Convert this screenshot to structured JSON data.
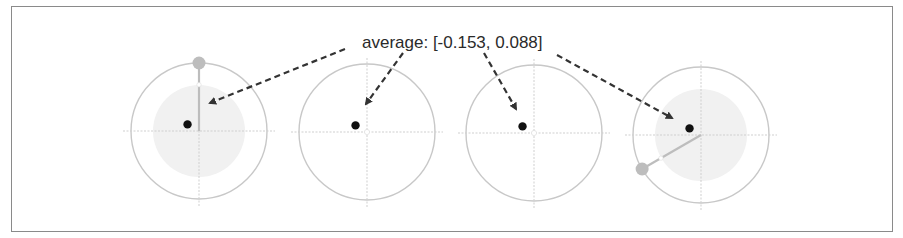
{
  "annotation": {
    "label": "average: [-0.153, 0.088]",
    "average": [
      -0.153,
      0.088
    ]
  },
  "colors": {
    "frame": "#8a8a8a",
    "circle_outline": "#c8c8c8",
    "axis": "#cfcfcf",
    "shaded_disc": "#f1f1f1",
    "handle": "#bdbdbd",
    "handle_line": "#bdbdbd",
    "average_dot": "#111111",
    "arrow": "#333333"
  },
  "panels": [
    {
      "id": "panel-1",
      "shaded": true,
      "handle": {
        "angle_deg": 90,
        "length": 1.0
      },
      "average": [
        -0.153,
        0.088
      ]
    },
    {
      "id": "panel-2",
      "shaded": false,
      "handle": null,
      "average": [
        -0.153,
        0.088
      ]
    },
    {
      "id": "panel-3",
      "shaded": false,
      "handle": null,
      "average": [
        -0.153,
        0.088
      ]
    },
    {
      "id": "panel-4",
      "shaded": true,
      "handle": {
        "angle_deg": 210,
        "length": 1.0
      },
      "average": [
        -0.153,
        0.088
      ]
    }
  ]
}
